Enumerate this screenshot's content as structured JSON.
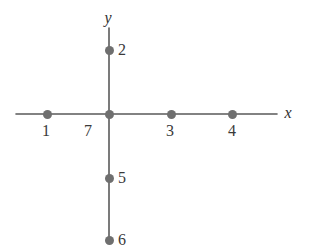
{
  "figure": {
    "background_color": "#ffffff",
    "line_color": "#5a5a5a",
    "dot_color": "#6f6f6f",
    "label_color": "#3a3a3a"
  },
  "axes": {
    "x_axis": {
      "label": "x",
      "label_x": 288,
      "label_y": 113,
      "x1": 16,
      "y1": 114,
      "x2": 277,
      "y2": 114
    },
    "y_axis": {
      "label": "y",
      "label_x": 108,
      "label_y": 18,
      "x1": 109,
      "y1": 28,
      "x2": 109,
      "y2": 240
    }
  },
  "chart_data": {
    "type": "scatter",
    "title": "",
    "xlabel": "x",
    "ylabel": "y",
    "grid": false,
    "legend": null,
    "points": [
      {
        "label": "1",
        "px": 47,
        "py": 114,
        "label_px": 46,
        "label_py": 131,
        "label_position": "below",
        "axis": "x",
        "side": "negative"
      },
      {
        "label": "7",
        "px": 109,
        "py": 114,
        "label_px": 88,
        "label_py": 131,
        "label_position": "below-left",
        "axis": "origin",
        "side": "origin"
      },
      {
        "label": "3",
        "px": 171,
        "py": 114,
        "label_px": 170,
        "label_py": 131,
        "label_position": "below",
        "axis": "x",
        "side": "positive"
      },
      {
        "label": "4",
        "px": 232,
        "py": 114,
        "label_px": 232,
        "label_py": 131,
        "label_position": "below",
        "axis": "x",
        "side": "positive"
      },
      {
        "label": "2",
        "px": 109,
        "py": 50,
        "label_px": 118,
        "label_py": 50,
        "label_position": "right",
        "axis": "y",
        "side": "positive"
      },
      {
        "label": "5",
        "px": 109,
        "py": 178,
        "label_px": 118,
        "label_py": 178,
        "label_position": "right",
        "axis": "y",
        "side": "negative"
      },
      {
        "label": "6",
        "px": 109,
        "py": 240,
        "label_px": 118,
        "label_py": 240,
        "label_position": "right",
        "axis": "y",
        "side": "negative"
      }
    ]
  }
}
